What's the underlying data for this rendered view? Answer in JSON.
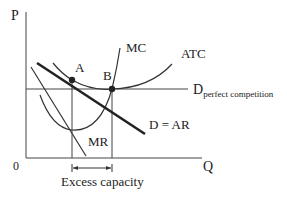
{
  "diagram": {
    "axes": {
      "y_label": "P",
      "x_label": "Q",
      "origin_label": "0"
    },
    "curves": {
      "mc": "MC",
      "atc": "ATC",
      "d_perfect": "D",
      "d_perfect_sub": "perfect competition",
      "d_ar": "D = AR",
      "mr": "MR"
    },
    "points": {
      "a": "A",
      "b": "B"
    },
    "annotation": "Excess capacity",
    "colors": {
      "line": "#222222",
      "thin_line": "#444444",
      "background": "#ffffff"
    }
  }
}
